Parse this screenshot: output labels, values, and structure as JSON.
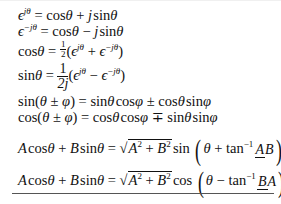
{
  "formulas": [
    {
      "id": "euler-pos",
      "lhs": "ϵ^{jθ}",
      "rhs": "cosθ + j sinθ"
    },
    {
      "id": "euler-neg",
      "lhs": "ϵ^{−jθ}",
      "rhs": "cosθ − j sinθ"
    },
    {
      "id": "cos-exp",
      "lhs": "cosθ",
      "rhs": "½(ϵ^{jθ} + ϵ^{−jθ})"
    },
    {
      "id": "sin-exp",
      "lhs": "sinθ",
      "rhs": "1/(2j) (ϵ^{jθ} − ϵ^{−jθ})"
    },
    {
      "id": "sin-sum",
      "lhs": "sin(θ ± φ)",
      "rhs": "sinθ cosφ ± cosθ sinφ"
    },
    {
      "id": "cos-sum",
      "lhs": "cos(θ ± φ)",
      "rhs": "cosθ cosφ ∓ sinθ sinφ"
    },
    {
      "id": "harmonic-sin",
      "lhs": "A cosθ + B sinθ",
      "rhs": "√(A²+B²) sin(θ + tan⁻¹ A/B)"
    },
    {
      "id": "harmonic-cos",
      "lhs": "A cosθ + B sinθ",
      "rhs": "√(A²+B²) cos(θ − tan⁻¹ B/A)"
    }
  ],
  "t": {
    "eps": "ϵ",
    "jth": "jθ",
    "mjth": "−jθ",
    "eq": " = ",
    "cos": "cos",
    "sin": "sin",
    "tan": "tan",
    "th": "θ",
    "ph": "φ",
    "plus": " + ",
    "minus": " − ",
    "pm": " ± ",
    "mp": " ∓ ",
    "j": "j",
    "one": "1",
    "two": "2",
    "twoj": "2j",
    "lp": "(",
    "rp": ")",
    "A": "A",
    "B": "B",
    "sq": "2",
    "inv": "−1",
    "root": "√"
  }
}
